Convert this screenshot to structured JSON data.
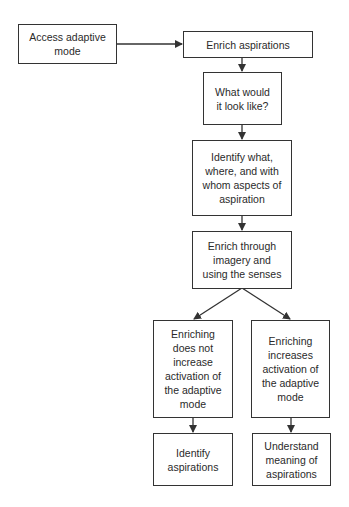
{
  "diagram": {
    "type": "flowchart",
    "nodes": [
      {
        "id": "access",
        "label": "Access adaptive\nmode"
      },
      {
        "id": "enrich",
        "label": "Enrich aspirations"
      },
      {
        "id": "what",
        "label": "What would\nit look like?"
      },
      {
        "id": "identify_what",
        "label": "Identify what,\nwhere, and with\nwhom aspects of\naspiration"
      },
      {
        "id": "imagery",
        "label": "Enrich through\nimagery and\nusing the senses"
      },
      {
        "id": "not_increase",
        "label": "Enriching\ndoes not\nincrease\nactivation of\nthe adaptive\nmode"
      },
      {
        "id": "increases",
        "label": "Enriching\nincreases\nactivation of\nthe adaptive\nmode"
      },
      {
        "id": "identify_asp",
        "label": "Identify\naspirations"
      },
      {
        "id": "understand",
        "label": "Understand\nmeaning of\naspirations"
      }
    ],
    "edges": [
      {
        "from": "access",
        "to": "enrich"
      },
      {
        "from": "enrich",
        "to": "what"
      },
      {
        "from": "what",
        "to": "identify_what"
      },
      {
        "from": "identify_what",
        "to": "imagery"
      },
      {
        "from": "imagery",
        "to": "not_increase"
      },
      {
        "from": "imagery",
        "to": "increases"
      },
      {
        "from": "not_increase",
        "to": "identify_asp"
      },
      {
        "from": "increases",
        "to": "understand"
      }
    ]
  }
}
